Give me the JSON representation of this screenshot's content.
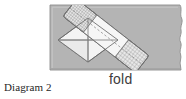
{
  "figure": {
    "caption": "Diagram 2",
    "fold_label": "fold",
    "alt_description": "Shaded rectangular sheet with a white folded square and a diagonal hatched strip laid across it",
    "colors": {
      "page_background": "#ffffff",
      "sheet_fill": "#b4b4b4",
      "sheet_border": "#8d8d8d",
      "sheet_highlight": "#c9c9c9",
      "square_fill": "#f2f2f2",
      "square_stroke": "#6b6b6b",
      "fold_line": "#8a8a8a",
      "strip_fill": "#efefef",
      "strip_stroke": "#6f6f6f",
      "hatch_line": "#9a9a9a",
      "caption_text": "#262626",
      "fold_text": "#3d3d3d"
    },
    "shapes": {
      "sheet": {
        "name": "paper-sheet",
        "x": 50,
        "y": 5,
        "width": 136,
        "height": 65,
        "torn_right_edge": true
      },
      "folded_square": {
        "name": "folded-square",
        "center_x": 88,
        "center_y": 40,
        "half_width": 30,
        "half_height": 22,
        "has_cross_fold_lines": true
      },
      "diagonal_strip": {
        "name": "diagonal-strip",
        "start_x": 72,
        "start_y": 9,
        "end_x": 141,
        "end_y": 63,
        "band_half_width": 11,
        "hatched_ends": true
      }
    }
  }
}
